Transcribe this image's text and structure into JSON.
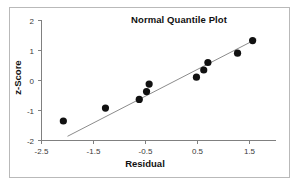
{
  "figure": {
    "background_color": "#ffffff",
    "border_color": "#b9b9b9",
    "marker_color": "#111111",
    "line_color": "#8c8c8c",
    "axis_color": "#808080"
  },
  "titles": {
    "chart": "Normal Quantile Plot",
    "x_axis": "Residual",
    "y_axis": "z-Score"
  },
  "axes": {
    "x_ticks": [
      "-2.5",
      "-1.5",
      "-0.5",
      "0.5",
      "1.5"
    ],
    "y_ticks": [
      "2",
      "1",
      "0",
      "-1",
      "-2"
    ]
  },
  "chart_data": {
    "type": "scatter",
    "title": "Normal Quantile Plot",
    "xlabel": "Residual",
    "ylabel": "z-Score",
    "xlim": [
      -2.5,
      1.9
    ],
    "ylim": [
      -2,
      2
    ],
    "xticks": [
      -2.5,
      -1.5,
      -0.5,
      0.5,
      1.5
    ],
    "yticks": [
      -2,
      -1,
      0,
      1,
      2
    ],
    "grid": false,
    "legend": false,
    "series": [
      {
        "name": "Sample quantiles",
        "marker": "filled-circle",
        "color": "#111111",
        "points": [
          {
            "x": -2.08,
            "y": -1.35
          },
          {
            "x": -1.27,
            "y": -0.92
          },
          {
            "x": -0.62,
            "y": -0.63
          },
          {
            "x": -0.48,
            "y": -0.37
          },
          {
            "x": -0.43,
            "y": -0.12
          },
          {
            "x": 0.48,
            "y": 0.11
          },
          {
            "x": 0.62,
            "y": 0.35
          },
          {
            "x": 0.7,
            "y": 0.6
          },
          {
            "x": 1.27,
            "y": 0.91
          },
          {
            "x": 1.56,
            "y": 1.33
          }
        ]
      },
      {
        "name": "Reference line",
        "type": "line",
        "color": "#8c8c8c",
        "endpoints": [
          {
            "x": -2.0,
            "y": -1.86
          },
          {
            "x": 1.63,
            "y": 1.38
          }
        ]
      }
    ]
  }
}
